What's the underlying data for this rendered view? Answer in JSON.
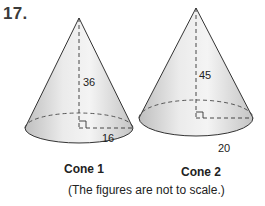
{
  "problem": {
    "number": "17."
  },
  "cones": [
    {
      "name": "Cone 1",
      "height_label": "36",
      "radius_label": "16"
    },
    {
      "name": "Cone 2",
      "height_label": "45",
      "radius_label": "20"
    }
  ],
  "caption": "(The figures are not to scale.)",
  "colors": {
    "cone_fill_light": "#f2f2f2",
    "cone_fill_dark": "#c8c8c8",
    "outline": "#333333",
    "text": "#222222"
  }
}
